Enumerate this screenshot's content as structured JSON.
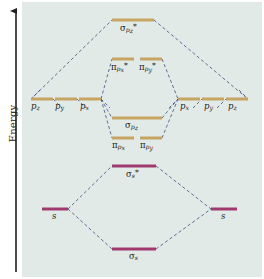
{
  "figure": {
    "type": "molecular-orbital-energy-diagram",
    "axis": {
      "label": "Energy",
      "direction": "increasing-upward",
      "arrow": "up-arrow-icon"
    },
    "colors": {
      "background": "#e2eae8",
      "page": "#ffffff",
      "p_level": "#c6a563",
      "p_level_dark": "#9d7b37",
      "s_level": "#a03a6e",
      "s_level_dark": "#7d2450",
      "connector": "#3d4f7c",
      "axis": "#231f20",
      "text": "#231f20"
    }
  },
  "atomic_orbitals": {
    "left": [
      {
        "id": "left-pz",
        "label": "p",
        "sub": "z",
        "x": 31,
        "y": 98,
        "width": 22,
        "label_x": 33,
        "label_y": 101
      },
      {
        "id": "left-py",
        "label": "p",
        "sub": "y",
        "x": 55,
        "y": 98,
        "width": 22,
        "label_x": 57,
        "label_y": 101
      },
      {
        "id": "left-px",
        "label": "p",
        "sub": "x",
        "x": 79,
        "y": 98,
        "width": 22,
        "label_x": 81,
        "label_y": 101
      },
      {
        "id": "left-s",
        "label": "s",
        "sub": "",
        "x": 42,
        "y": 208,
        "width": 26,
        "label_x": 51,
        "label_y": 211
      }
    ],
    "right": [
      {
        "id": "right-px",
        "label": "p",
        "sub": "x",
        "x": 178,
        "y": 98,
        "width": 22,
        "label_x": 180,
        "label_y": 101
      },
      {
        "id": "right-py",
        "label": "p",
        "sub": "y",
        "x": 202,
        "y": 98,
        "width": 22,
        "label_x": 204,
        "label_y": 101
      },
      {
        "id": "right-pz",
        "label": "p",
        "sub": "z",
        "x": 226,
        "y": 98,
        "width": 22,
        "label_x": 228,
        "label_y": 101
      },
      {
        "id": "right-s",
        "label": "s",
        "sub": "",
        "x": 211,
        "y": 208,
        "width": 26,
        "label_x": 220,
        "label_y": 211
      }
    ]
  },
  "molecular_orbitals": [
    {
      "id": "sigma-pz-star",
      "symbol": "σ",
      "sub": "p",
      "subsub": "z",
      "star": "*",
      "kind": "antibonding",
      "color": "p",
      "x": 112,
      "y": 19,
      "width": 42,
      "label_x": 119,
      "label_y": 23
    },
    {
      "id": "pi-px-star",
      "symbol": "π",
      "sub": "p",
      "subsub": "x",
      "star": "*",
      "kind": "antibonding",
      "color": "p",
      "x": 112,
      "y": 58,
      "width": 22,
      "label_x": 112,
      "label_y": 62
    },
    {
      "id": "pi-py-star",
      "symbol": "π",
      "sub": "p",
      "subsub": "y",
      "star": "*",
      "kind": "antibonding",
      "color": "p",
      "x": 140,
      "y": 58,
      "width": 22,
      "label_x": 140,
      "label_y": 62
    },
    {
      "id": "sigma-pz",
      "symbol": "σ",
      "sub": "p",
      "subsub": "z",
      "star": "",
      "kind": "bonding",
      "color": "p",
      "x": 112,
      "y": 117,
      "width": 50,
      "label_x": 124,
      "label_y": 121
    },
    {
      "id": "pi-px",
      "symbol": "π",
      "sub": "p",
      "subsub": "x",
      "star": "",
      "kind": "bonding",
      "color": "p",
      "x": 112,
      "y": 137,
      "width": 22,
      "label_x": 113,
      "label_y": 141
    },
    {
      "id": "pi-py",
      "symbol": "π",
      "sub": "p",
      "subsub": "y",
      "star": "",
      "kind": "bonding",
      "color": "p",
      "x": 140,
      "y": 137,
      "width": 22,
      "label_x": 141,
      "label_y": 141
    },
    {
      "id": "sigma-s-star",
      "symbol": "σ",
      "sub": "s",
      "subsub": "",
      "star": "*",
      "kind": "antibonding",
      "color": "s",
      "x": 112,
      "y": 165,
      "width": 44,
      "label_x": 125,
      "label_y": 169
    },
    {
      "id": "sigma-s",
      "symbol": "σ",
      "sub": "s",
      "subsub": "",
      "star": "",
      "kind": "bonding",
      "color": "s",
      "x": 112,
      "y": 248,
      "width": 44,
      "label_x": 128,
      "label_y": 252
    }
  ],
  "level_text": {
    "sigma_pz_star": "σ",
    "pi_px_star": "π",
    "pi_py_star": "π",
    "sigma_pz": "σ",
    "pi_px": "π",
    "pi_py": "π",
    "sigma_s_star": "σ",
    "sigma_s": "σ",
    "sub_p": "p",
    "sub_s": "s",
    "sub_x": "x",
    "sub_y": "y",
    "sub_z": "z",
    "star": "*",
    "ao_p": "p",
    "ao_s": "s"
  }
}
